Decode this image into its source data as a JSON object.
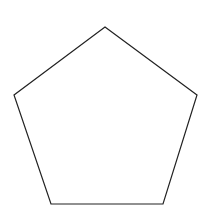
{
  "diagram": {
    "shape": "pentagon",
    "sides": 5,
    "fill": "#ffffff",
    "stroke": "#222222",
    "stroke_width": 1.2,
    "vertices": [
      [
        105,
        27
      ],
      [
        197,
        95
      ],
      [
        163,
        204
      ],
      [
        51,
        204
      ],
      [
        14,
        95
      ]
    ]
  }
}
